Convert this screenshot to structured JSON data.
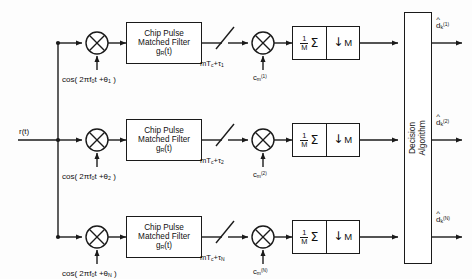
{
  "diagram": {
    "input": {
      "label": "r(t)"
    },
    "branches": [
      {
        "id": "branch-1",
        "carrier_label": "cos( 2πf₀t + θ₁ )",
        "filter_line1": "Chip Pulse",
        "filter_line2": "Matched Filter",
        "filter_line3": "gR(t)",
        "sampler_label": "mTc + τ₁",
        "code_label": "cm⁽¹⁾",
        "accum_numerator": "1",
        "accum_denominator": "M",
        "accum_symbol": "Σ",
        "downsample_label": "M",
        "downsample_arrow": "↓",
        "output_label": "d̂k⁽¹⁾"
      },
      {
        "id": "branch-2",
        "carrier_label": "cos( 2πf₀t + θ₂ )",
        "filter_line1": "Chip Pulse",
        "filter_line2": "Matched Filter",
        "filter_line3": "gR(t)",
        "sampler_label": "mTc + τ₂",
        "code_label": "cm⁽²⁾",
        "accum_numerator": "1",
        "accum_denominator": "M",
        "accum_symbol": "Σ",
        "downsample_label": "M",
        "downsample_arrow": "↓",
        "output_label": "d̂k⁽²⁾"
      },
      {
        "id": "branch-n",
        "carrier_label": "cos( 2πf₀t + θN )",
        "filter_line1": "Chip Pulse",
        "filter_line2": "Matched Filter",
        "filter_line3": "gR(t)",
        "sampler_label": "mTc + τN",
        "code_label": "cm⁽ᴺ⁾",
        "accum_numerator": "1",
        "accum_denominator": "M",
        "accum_symbol": "Σ",
        "downsample_label": "M",
        "downsample_arrow": "↓",
        "output_label": "d̂k⁽ᴺ⁾"
      }
    ],
    "decision_block": {
      "line1": "Decision",
      "line2": "Algorithm"
    },
    "colors": {
      "line": "#1a1a1a",
      "background": "#fdfdfd",
      "block_fill": "#ffffff"
    }
  }
}
